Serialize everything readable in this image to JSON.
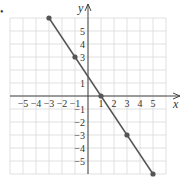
{
  "chart_data": {
    "type": "line",
    "title": "",
    "xlabel": "x",
    "ylabel": "y",
    "xlim": [
      -6,
      6
    ],
    "ylim": [
      -6,
      6
    ],
    "grid": true,
    "x_ticks": [
      "-5",
      "-4",
      "-3",
      "-2",
      "-1",
      "1",
      "2",
      "3",
      "4",
      "5"
    ],
    "y_ticks": [
      "5",
      "4",
      "3",
      "1",
      "-1",
      "-2",
      "-3",
      "-4",
      "-5"
    ],
    "series": [
      {
        "name": "line",
        "points": [
          {
            "x": -3,
            "y": 6
          },
          {
            "x": -1,
            "y": 3
          },
          {
            "x": 1,
            "y": 0
          },
          {
            "x": 3,
            "y": -3
          },
          {
            "x": 5,
            "y": -6
          }
        ]
      }
    ],
    "colors": {
      "line": "#555555",
      "point": "#555555",
      "grid": "#d9d9d9",
      "axis": "#444444"
    }
  },
  "labels": {
    "bullet": "•",
    "x_axis": "x",
    "y_axis": "y"
  }
}
